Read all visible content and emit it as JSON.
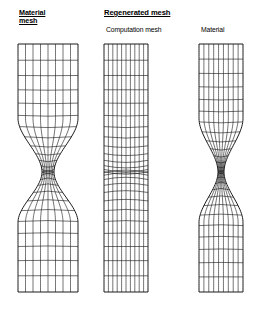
{
  "figure": {
    "title_left": "Material\nmesh",
    "background_color": "#ffffff",
    "line_color": "#1a1a1a"
  },
  "labels": {
    "material_mesh_line1": "Material",
    "material_mesh_line2": "mesh",
    "regenerated_mesh": "Regenerated mesh",
    "computation_mesh": "Computation mesh",
    "material_right": "Material"
  },
  "panels": [
    {
      "id": "left",
      "name": "material-mesh-panel",
      "label": "Material mesh",
      "style": "necked-material",
      "x_center": 48,
      "half_width_top": 30,
      "half_width_neck": 6,
      "y_top": 44,
      "y_bottom": 292,
      "y_neck": 172,
      "n_columns": 8,
      "n_rows": 26
    },
    {
      "id": "center",
      "name": "computation-mesh-panel",
      "label": "Computation mesh",
      "style": "straight-computation",
      "x_center": 126,
      "half_width_top": 22,
      "half_width_neck": 22,
      "y_top": 44,
      "y_bottom": 292,
      "y_neck": 172,
      "n_columns": 10,
      "n_rows": 26
    },
    {
      "id": "right",
      "name": "material-right-panel",
      "label": "Material",
      "style": "necked-material",
      "x_center": 221,
      "half_width_top": 22,
      "half_width_neck": 3,
      "y_top": 44,
      "y_bottom": 292,
      "y_neck": 172,
      "n_columns": 9,
      "n_rows": 28
    }
  ],
  "chart_data": {
    "type": "diagram",
    "title": "Regenerated mesh",
    "neck_position_y": 172,
    "specimen_top_y": 44,
    "specimen_bottom_y": 292
  }
}
